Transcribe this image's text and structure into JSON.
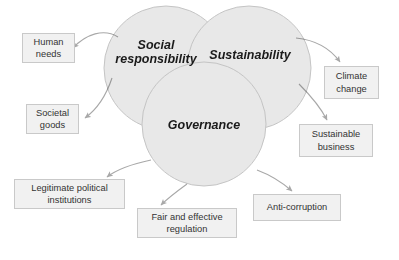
{
  "diagram": {
    "type": "venn",
    "colors": {
      "circle_fill": "#e8e8e8",
      "circle_stroke": "#c4c4c4",
      "box_fill": "#f1f1f1",
      "box_stroke": "#c9c9c9",
      "arrow_stroke": "#a8a8a8",
      "text": "#333333",
      "circle_text": "#1a1a1a",
      "background": "#ffffff"
    },
    "circles": [
      {
        "id": "social",
        "label": "Social\nresponsibility",
        "cx": 166,
        "cy": 68,
        "r": 62
      },
      {
        "id": "sustainability",
        "label": "Sustainability",
        "cx": 249,
        "cy": 68,
        "r": 62
      },
      {
        "id": "governance",
        "label": "Governance",
        "cx": 204,
        "cy": 124,
        "r": 62
      }
    ],
    "boxes": [
      {
        "id": "human-needs",
        "label": "Human\nneeds",
        "from": "social"
      },
      {
        "id": "societal-goods",
        "label": "Societal\ngoods",
        "from": "social"
      },
      {
        "id": "legitimate",
        "label": "Legitimate political\ninstitutions",
        "from": "governance"
      },
      {
        "id": "fair-regulation",
        "label": "Fair and effective\nregulation",
        "from": "governance"
      },
      {
        "id": "anti-corruption",
        "label": "Anti-corruption",
        "from": "governance"
      },
      {
        "id": "climate-change",
        "label": "Climate\nchange",
        "from": "sustainability"
      },
      {
        "id": "sustainable-business",
        "label": "Sustainable\nbusiness",
        "from": "sustainability"
      }
    ]
  }
}
